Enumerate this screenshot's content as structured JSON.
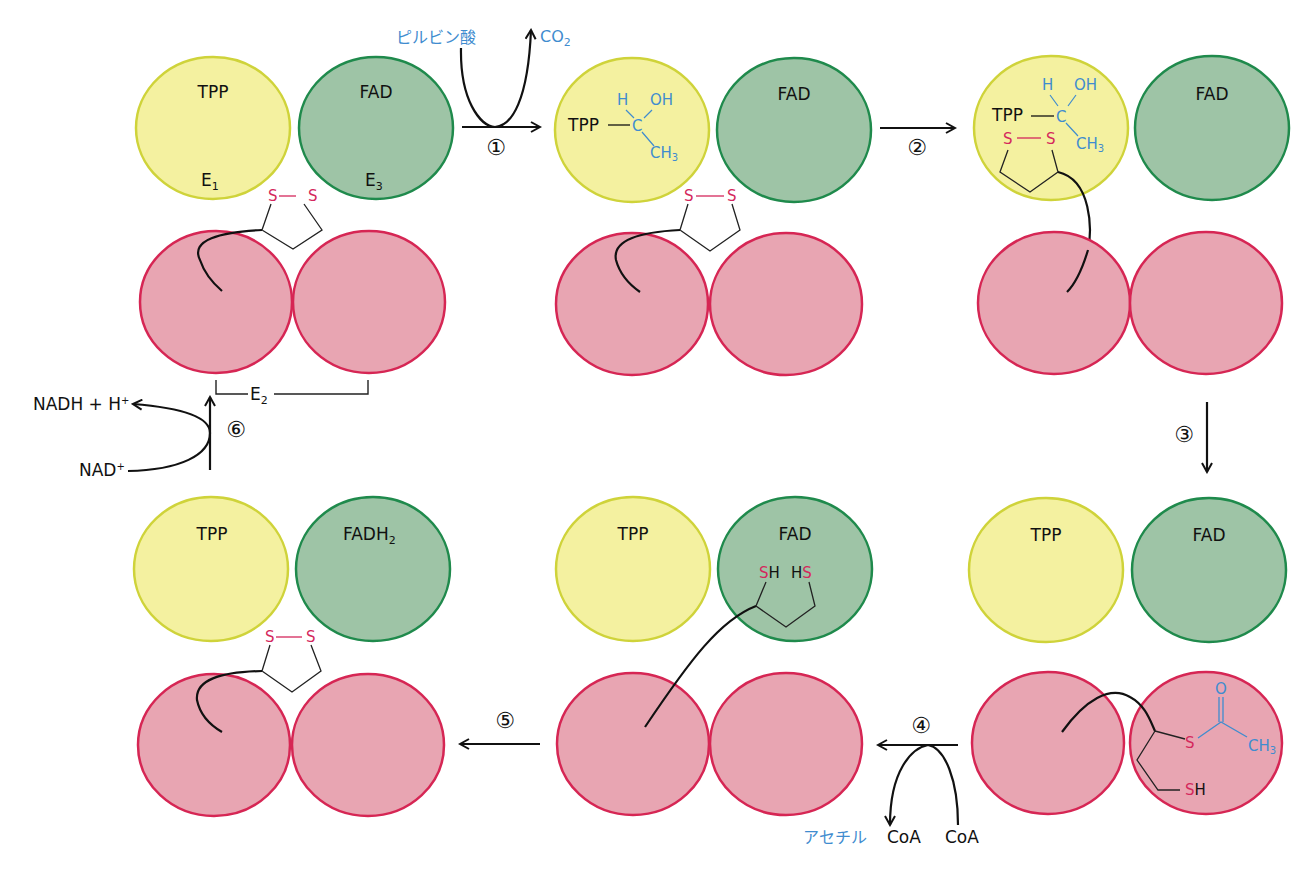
{
  "colors": {
    "e1_fill": "#f4f1a0",
    "e1_stroke": "#cfd33a",
    "e3_fill": "#9ec4a6",
    "e3_stroke": "#1f8a4c",
    "e2_fill": "#e8a5b2",
    "e2_stroke": "#d62654",
    "blue": "#3f8ccf",
    "red": "#d4285c"
  },
  "labels": {
    "tpp": "TPP",
    "fad": "FAD",
    "fadh2": "FADH",
    "fadh2_sub": "2",
    "e1": "E",
    "e1_sub": "1",
    "e2": "E",
    "e2_sub": "2",
    "e3": "E",
    "e3_sub": "3",
    "s": "S",
    "h": "H",
    "oh": "OH",
    "c": "C",
    "ch3": "CH",
    "ch3_sub": "3",
    "o": "O",
    "sh": "SH"
  },
  "steps": {
    "s1": "①",
    "s2": "②",
    "s3": "③",
    "s4": "④",
    "s5": "⑤",
    "s6": "⑥"
  },
  "reactants": {
    "pyruvate": "ピルビン酸",
    "co2": "CO",
    "co2_sub": "2",
    "acetyl": "アセチル",
    "coa": "CoA",
    "coa2": "CoA",
    "nadh": "NADH + H",
    "nadh_sup": "+",
    "nad": "NAD",
    "nad_sup": "+"
  }
}
